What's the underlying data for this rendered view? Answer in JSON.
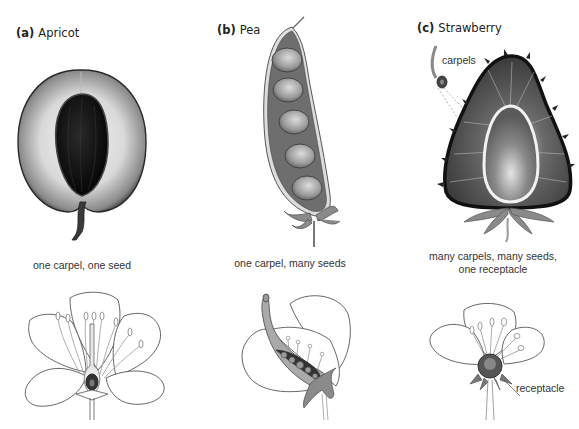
{
  "figure": {
    "panels": [
      {
        "letter": "(a)",
        "name": "Apricot",
        "caption": "one carpel, one seed"
      },
      {
        "letter": "(b)",
        "name": "Pea",
        "caption": "one carpel, many seeds"
      },
      {
        "letter": "(c)",
        "name": "Strawberry",
        "caption_line1": "many carpels, many seeds,",
        "caption_line2": "one receptacle",
        "annotations": {
          "carpels": "carpels",
          "receptacle": "receptacle"
        }
      }
    ]
  }
}
